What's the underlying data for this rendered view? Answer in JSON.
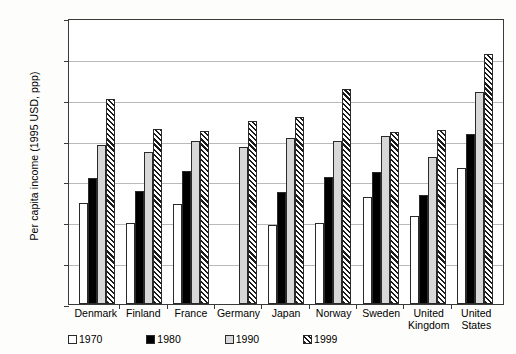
{
  "chart_data": {
    "type": "bar",
    "title": "",
    "xlabel": "",
    "ylabel": "Per capita income (1995 USD, ppp)",
    "ylim": [
      0,
      35000
    ],
    "yticks": [
      0,
      5000,
      10000,
      15000,
      20000,
      25000,
      30000,
      35000
    ],
    "ytick_labels": [
      "0",
      "5000",
      "10000",
      "15000",
      "20000",
      "25000",
      "30000",
      "35000"
    ],
    "grid": true,
    "legend_position": "below-axes-left",
    "categories": [
      "Denmark",
      "Finland",
      "France",
      "Germany",
      "Japan",
      "Norway",
      "Sweden",
      "United\nKingdom",
      "United\nStates"
    ],
    "series": [
      {
        "name": "1970",
        "fill": "open-white",
        "values": [
          12400,
          9900,
          12300,
          null,
          9700,
          9900,
          13100,
          10800,
          16700
        ]
      },
      {
        "name": "1980",
        "fill": "solid-black",
        "values": [
          15400,
          13800,
          16300,
          null,
          13700,
          15500,
          16100,
          13300,
          20800
        ]
      },
      {
        "name": "1990",
        "fill": "dotted-gray",
        "values": [
          19400,
          18600,
          19900,
          19200,
          20300,
          19900,
          20600,
          18000,
          26000
        ]
      },
      {
        "name": "1999",
        "fill": "diagonal-hatch",
        "values": [
          25100,
          21400,
          21200,
          22400,
          22900,
          26300,
          21000,
          21300,
          30600
        ]
      }
    ]
  },
  "legend": {
    "items": [
      {
        "label": "1970"
      },
      {
        "label": "1980"
      },
      {
        "label": "1990"
      },
      {
        "label": "1999"
      }
    ]
  }
}
